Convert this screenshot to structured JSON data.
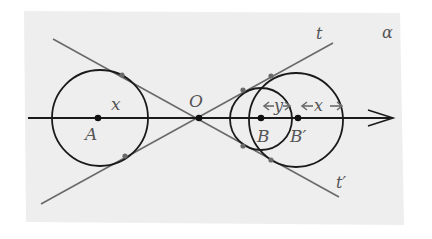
{
  "figure": {
    "plane_label": "α",
    "colors": {
      "background": "#ffffff",
      "plane": "#eeeeee",
      "curve": "#1a1a1a",
      "tangent": "#6a6a6a",
      "label": "#555555"
    },
    "points": [
      {
        "id": "A",
        "label": "A",
        "x": 98,
        "y": 118
      },
      {
        "id": "O",
        "label": "O",
        "x": 199,
        "y": 118
      },
      {
        "id": "B",
        "label": "B",
        "x": 261,
        "y": 118
      },
      {
        "id": "B_prime",
        "label": "B′",
        "x": 298,
        "y": 118
      }
    ],
    "circles": [
      {
        "id": "circle-A",
        "cx": 100,
        "cy": 118,
        "r": 48
      },
      {
        "id": "circle-B",
        "cx": 261,
        "cy": 119,
        "r": 31
      },
      {
        "id": "circle-B-prime",
        "cx": 296,
        "cy": 120,
        "r": 47
      }
    ],
    "lines": [
      {
        "id": "tangent-t",
        "label": "t",
        "x1": 41,
        "y1": 204,
        "x2": 333,
        "y2": 43
      },
      {
        "id": "tangent-t-prime",
        "label": "t′",
        "x1": 53,
        "y1": 39,
        "x2": 339,
        "y2": 197
      }
    ],
    "axis": {
      "x1": 28,
      "y1": 118,
      "x2": 393,
      "y2": 118
    },
    "measures": [
      {
        "id": "radius-A",
        "label": "x"
      },
      {
        "id": "radius-B",
        "label": "y"
      },
      {
        "id": "offset-B-prime",
        "label": "x"
      }
    ]
  }
}
